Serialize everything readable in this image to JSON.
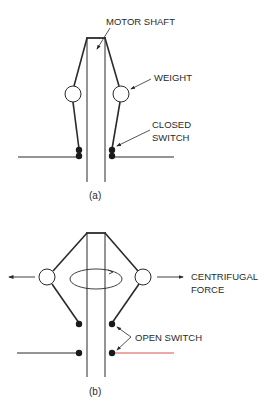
{
  "figure": {
    "panel_a": {
      "caption": "(a)",
      "labels": {
        "motor_shaft": "MOTOR SHAFT",
        "weight": "WEIGHT",
        "closed_switch_line1": "CLOSED",
        "closed_switch_line2": "SWITCH"
      }
    },
    "panel_b": {
      "caption": "(b)",
      "labels": {
        "centrifugal_line1": "CENTRIFUGAL",
        "centrifugal_line2": "FORCE",
        "open_switch": "OPEN SWITCH"
      }
    },
    "colors": {
      "line": "#2a2a2a",
      "wire_highlight": "#d9534f"
    }
  }
}
